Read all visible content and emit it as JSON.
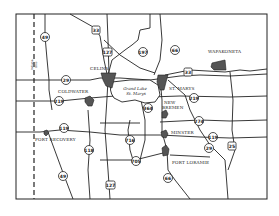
{
  "map": {
    "title": "Grand Lake St. Marys region road map",
    "state_line_label": [
      "Indiana",
      "Ohio"
    ],
    "lake": {
      "label_line1": "Grand Lake",
      "label_line2": "St. Marys"
    },
    "towns": [
      {
        "name": "CELINA"
      },
      {
        "name": "COLDWATER"
      },
      {
        "name": "ST. MARYS"
      },
      {
        "name": "WAPAKONETA"
      },
      {
        "name": "NEW"
      },
      {
        "name": "BREMEN"
      },
      {
        "name": "MINSTER"
      },
      {
        "name": "FORT LORAMIE"
      },
      {
        "name": "FORT RECOVERY"
      }
    ],
    "routes": {
      "r49a": "49",
      "r49b": "49",
      "r33": "33",
      "r127a": "127",
      "r127b": "127",
      "r197": "197",
      "r66a": "66",
      "r66b": "66",
      "r33b": "33",
      "r29a": "29",
      "r29b": "29",
      "r219a": "219",
      "r219b": "219",
      "r364": "364",
      "r274": "274",
      "r119a": "119",
      "r119b": "119",
      "r118": "118",
      "r716": "716",
      "r705": "705",
      "r25": "25"
    }
  }
}
